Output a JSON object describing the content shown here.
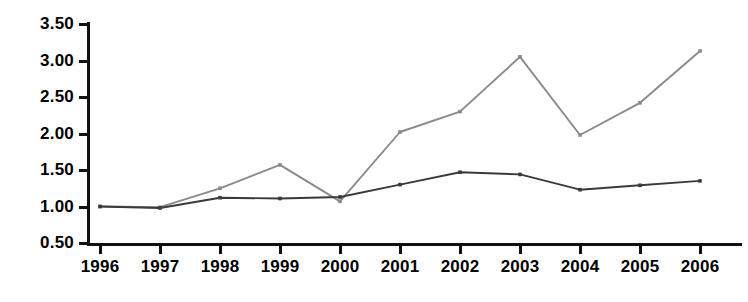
{
  "chart_data": {
    "type": "line",
    "title": "",
    "subtitle": "",
    "xlabel": "",
    "ylabel": "",
    "categories": [
      "1996",
      "1997",
      "1998",
      "1999",
      "2000",
      "2001",
      "2002",
      "2003",
      "2004",
      "2005",
      "2006"
    ],
    "x": [
      1996,
      1997,
      1998,
      1999,
      2000,
      2001,
      2002,
      2003,
      2004,
      2005,
      2006
    ],
    "ylim": [
      0.5,
      3.5
    ],
    "ytick_labels": [
      "0.50",
      "1.00",
      "1.50",
      "2.00",
      "2.50",
      "3.00",
      "3.50"
    ],
    "ytick_values": [
      0.5,
      1.0,
      1.5,
      2.0,
      2.5,
      3.0,
      3.5
    ],
    "grid": false,
    "legend_position": "none",
    "markers": "small-square",
    "series": [
      {
        "name": "series-1",
        "color": "#8a8a8a",
        "values": [
          1.0,
          0.99,
          1.25,
          1.57,
          1.07,
          2.02,
          2.3,
          3.05,
          1.98,
          2.42,
          3.13
        ]
      },
      {
        "name": "series-2",
        "color": "#3a3a3a",
        "values": [
          1.0,
          0.98,
          1.12,
          1.11,
          1.13,
          1.3,
          1.47,
          1.44,
          1.23,
          1.29,
          1.35
        ]
      }
    ]
  },
  "caption": {
    "cropped_text": ""
  }
}
